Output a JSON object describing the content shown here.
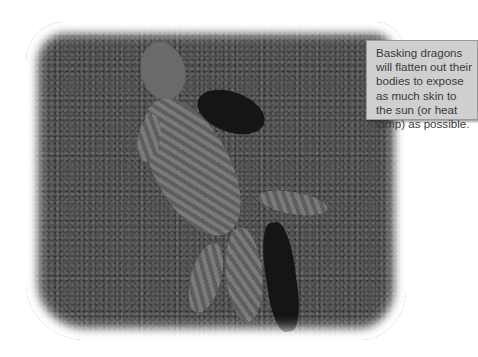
{
  "figure": {
    "style": "grayscale photo with feathered white vignette"
  },
  "callout": {
    "text": "Basking dragons will flatten out their bodies to expose as much skin to the sun (or heat lamp) as possible.",
    "background_color": "#cfcfcf",
    "text_color": "#3a3a3a"
  }
}
